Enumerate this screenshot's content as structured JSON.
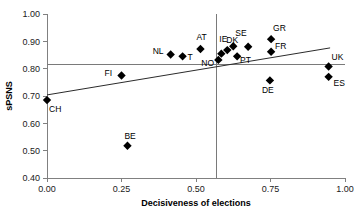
{
  "chart_data": {
    "type": "scatter",
    "title": "",
    "xlabel": "Decisiveness of elections",
    "ylabel": "sPSNS",
    "xlim": [
      0.0,
      1.0
    ],
    "ylim": [
      0.4,
      1.0
    ],
    "xticks": [
      "0.00",
      "0.25",
      "0.50",
      "0.75",
      "1.00"
    ],
    "xtick_values": [
      0.0,
      0.25,
      0.5,
      0.75,
      1.0
    ],
    "yticks": [
      "0.40",
      "0.50",
      "0.60",
      "0.70",
      "0.80",
      "0.90",
      "1.00"
    ],
    "ytick_values": [
      0.4,
      0.5,
      0.6,
      0.7,
      0.8,
      0.9,
      1.0
    ],
    "grid": false,
    "legend": "none",
    "points": [
      {
        "label": "CH",
        "x": 0.0,
        "y": 0.685,
        "label_dx": 2,
        "label_dy": 12
      },
      {
        "label": "BE",
        "x": 0.27,
        "y": 0.518,
        "label_dx": -3,
        "label_dy": -7
      },
      {
        "label": "FI",
        "x": 0.25,
        "y": 0.775,
        "label_dx": -17,
        "label_dy": 0
      },
      {
        "label": "NL",
        "x": 0.415,
        "y": 0.852,
        "label_dx": -18,
        "label_dy": 0
      },
      {
        "label": "T",
        "x": 0.455,
        "y": 0.845,
        "label_dx": 5,
        "label_dy": 4
      },
      {
        "label": "AT",
        "x": 0.515,
        "y": 0.872,
        "label_dx": -4,
        "label_dy": -9
      },
      {
        "label": "NO",
        "x": 0.575,
        "y": 0.832,
        "label_dx": -17,
        "label_dy": 6
      },
      {
        "label": "IE",
        "x": 0.585,
        "y": 0.855,
        "label_dx": -2,
        "label_dy": -12
      },
      {
        "label": "DK",
        "x": 0.605,
        "y": 0.868,
        "label_dx": -1,
        "label_dy": -7
      },
      {
        "label": "SE",
        "x": 0.625,
        "y": 0.882,
        "label_dx": 2,
        "label_dy": -10
      },
      {
        "label": "PT",
        "x": 0.638,
        "y": 0.845,
        "label_dx": 3,
        "label_dy": 7
      },
      {
        "label": "GR",
        "x": 0.752,
        "y": 0.908,
        "label_dx": 2,
        "label_dy": -8
      },
      {
        "label": "FR",
        "x": 0.752,
        "y": 0.862,
        "label_dx": 4,
        "label_dy": -3
      },
      {
        "label": "DE",
        "x": 0.748,
        "y": 0.757,
        "label_dx": -8,
        "label_dy": 13
      },
      {
        "label": "UK",
        "x": 0.945,
        "y": 0.808,
        "label_dx": 3,
        "label_dy": -6
      },
      {
        "label": "ES",
        "x": 0.945,
        "y": 0.77,
        "label_dx": 5,
        "label_dy": 9
      },
      {
        "label": "",
        "x": 0.675,
        "y": 0.88,
        "label_dx": 0,
        "label_dy": 0
      }
    ],
    "reference_lines": {
      "horizontal_y": 0.815,
      "vertical_x": 0.568
    },
    "trend_line": {
      "x0": 0.0,
      "y0": 0.704,
      "x1": 0.95,
      "y1": 0.876
    }
  }
}
